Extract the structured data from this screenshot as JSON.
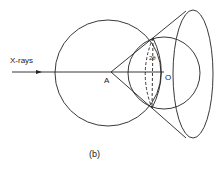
{
  "figure": {
    "caption": "(b)",
    "labels": {
      "xrays": "X-rays",
      "point_a": "A",
      "point_o": "O",
      "angle": "2θ"
    }
  }
}
